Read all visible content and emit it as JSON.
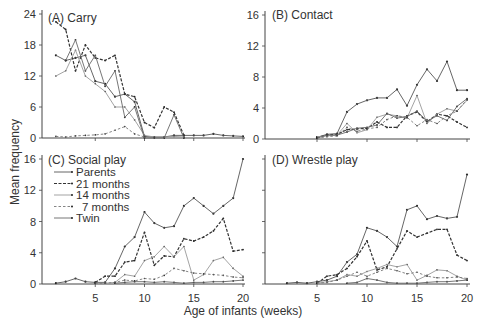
{
  "figure": {
    "ylabel": "Mean frequency",
    "xlabel": "Age of infants (weeks)",
    "legend": [
      {
        "label": "Parents",
        "style": "solid-dots"
      },
      {
        "label": "21 months",
        "style": "dashed-heavy"
      },
      {
        "label": "14 months",
        "style": "solid-light"
      },
      {
        "label": "7 months",
        "style": "dashed-light"
      },
      {
        "label": "Twin",
        "style": "solid"
      }
    ]
  },
  "chart_data": [
    {
      "type": "line",
      "title": "(A) Carry",
      "xlabel": "Age of infants (weeks)",
      "ylabel": "Mean frequency",
      "yticks": [
        0,
        6,
        12,
        18,
        24
      ],
      "ylim": [
        0,
        24
      ],
      "xticks": [
        5,
        10,
        15,
        20
      ],
      "xlim": [
        0,
        20
      ],
      "x": [
        1,
        2,
        3,
        4,
        5,
        6,
        7,
        8,
        9,
        10,
        11,
        12,
        13,
        14,
        15,
        16,
        17,
        18,
        19,
        20
      ],
      "series": [
        {
          "name": "Parents",
          "values": [
            16,
            15,
            15.5,
            16,
            11,
            10.5,
            8,
            8.5,
            7,
            0.3,
            0.2,
            0.2,
            0.5,
            0.5,
            0.5,
            0.5,
            0.8,
            0.5,
            0.4,
            0.3
          ]
        },
        {
          "name": "21 months",
          "values": [
            22.5,
            21,
            13,
            18,
            15.5,
            15,
            16,
            8.5,
            8,
            3,
            2,
            6,
            5,
            0.5,
            null,
            null,
            null,
            null,
            null,
            null
          ]
        },
        {
          "name": "14 months",
          "values": [
            12,
            13,
            17,
            12,
            10.5,
            9,
            6,
            6,
            3.5,
            0.5,
            0.2,
            0.2,
            0.3,
            0.2,
            null,
            null,
            null,
            null,
            null,
            null
          ]
        },
        {
          "name": "7 months",
          "values": [
            0.3,
            0.2,
            0.4,
            0.5,
            0.6,
            0.8,
            1.5,
            2.2,
            0.8,
            0.2,
            null,
            null,
            null,
            null,
            null,
            null,
            null,
            null,
            null,
            null
          ]
        },
        {
          "name": "Twin",
          "values": [
            null,
            15,
            19,
            13,
            16,
            10,
            13,
            4,
            6,
            0,
            0,
            0,
            4.5,
            0,
            null,
            null,
            null,
            null,
            null,
            null
          ]
        }
      ]
    },
    {
      "type": "line",
      "title": "(B) Contact",
      "xlabel": "Age of infants (weeks)",
      "ylabel": "Mean frequency",
      "yticks": [
        0,
        4,
        8,
        12,
        16
      ],
      "ylim": [
        0,
        16
      ],
      "xticks": [
        5,
        10,
        15,
        20
      ],
      "xlim": [
        0,
        20
      ],
      "x": [
        5,
        6,
        7,
        8,
        9,
        10,
        11,
        12,
        13,
        14,
        15,
        16,
        17,
        18,
        19,
        20
      ],
      "series": [
        {
          "name": "Parents",
          "values": [
            0.2,
            0.6,
            0.7,
            3.5,
            4.5,
            5,
            5.3,
            5.3,
            6.4,
            4.3,
            7,
            9,
            7.5,
            10,
            6.3,
            6.3
          ]
        },
        {
          "name": "21 months",
          "values": [
            0.2,
            0.5,
            0.6,
            1.2,
            1.3,
            1.4,
            2.2,
            1.5,
            1.5,
            3,
            3.5,
            2.2,
            3.2,
            3,
            2.2,
            1.5
          ]
        },
        {
          "name": "14 months",
          "values": [
            0.3,
            0.4,
            0.5,
            2.0,
            0.8,
            1.2,
            2.8,
            3.2,
            3.0,
            2.7,
            5.6,
            2.0,
            3.2,
            3.9,
            3.6,
            5.0
          ]
        },
        {
          "name": "7 months",
          "values": [
            0.1,
            0.3,
            0.4,
            1.5,
            1.0,
            1.3,
            1.5,
            2.5,
            3.0,
            2.8,
            1.7,
            2.5,
            2.0,
            3.0,
            3.6,
            5.1
          ]
        },
        {
          "name": "Twin",
          "values": [
            0.1,
            0.5,
            0.5,
            0.9,
            1.4,
            1.5,
            1.8,
            3.3,
            2.7,
            2.9,
            3.6,
            2.3,
            3.0,
            2.4,
            4.2,
            5.2
          ]
        }
      ]
    },
    {
      "type": "line",
      "title": "(C) Social play",
      "xlabel": "Age of infants (weeks)",
      "ylabel": "Mean frequency",
      "yticks": [
        0,
        4,
        8,
        12,
        16
      ],
      "ylim": [
        0,
        16
      ],
      "xticks": [
        5,
        10,
        15,
        20
      ],
      "xlim": [
        0,
        20
      ],
      "x": [
        1,
        2,
        3,
        4,
        5,
        6,
        7,
        8,
        9,
        10,
        11,
        12,
        13,
        14,
        15,
        16,
        17,
        18,
        19,
        20
      ],
      "series": [
        {
          "name": "Parents",
          "values": [
            0.1,
            0.3,
            0.7,
            0.3,
            0.2,
            0.2,
            2,
            4.8,
            6,
            9.2,
            7.8,
            7.2,
            7.4,
            10,
            11,
            10,
            9,
            10,
            11,
            16
          ]
        },
        {
          "name": "21 months",
          "values": [
            null,
            null,
            null,
            null,
            0.2,
            1,
            1,
            2.8,
            3,
            6.6,
            2.4,
            3.6,
            3.5,
            5.8,
            5.5,
            6,
            6.8,
            8.4,
            4.2,
            4.4
          ]
        },
        {
          "name": "14 months",
          "values": [
            null,
            null,
            null,
            null,
            0.1,
            0.1,
            0.2,
            1.2,
            1,
            3,
            3.5,
            4.8,
            3.5,
            4.8,
            0.5,
            1.2,
            3,
            3.4,
            2,
            1
          ]
        },
        {
          "name": "7 months",
          "values": [
            null,
            null,
            null,
            null,
            0.1,
            0.1,
            0.2,
            0.5,
            0.4,
            0.7,
            0.6,
            1.1,
            2,
            1.7,
            1.4,
            1.3,
            1.2,
            1.1,
            0.9,
            0.8
          ]
        },
        {
          "name": "Twin",
          "values": [
            null,
            null,
            null,
            null,
            null,
            null,
            0.1,
            0.2,
            0.3,
            0.3,
            0.2,
            0.3,
            0.2,
            0.1,
            0.2,
            0.2,
            0.3,
            0.3,
            0.4,
            0.5
          ]
        }
      ]
    },
    {
      "type": "line",
      "title": "(D) Wrestle play",
      "xlabel": "Age of infants (weeks)",
      "ylabel": "Mean frequency",
      "yticks": [
        0,
        4,
        8,
        12,
        16
      ],
      "ylim": [
        0,
        16
      ],
      "xticks": [
        5,
        10,
        15,
        20
      ],
      "xlim": [
        0,
        20
      ],
      "x": [
        2,
        3,
        4,
        5,
        6,
        7,
        8,
        9,
        10,
        11,
        12,
        13,
        14,
        15,
        16,
        17,
        18,
        19,
        20
      ],
      "series": [
        {
          "name": "Parents",
          "values": [
            0.1,
            0.2,
            0.1,
            0.3,
            0.5,
            1,
            2.8,
            3.8,
            7.2,
            6.8,
            6,
            4.8,
            9.5,
            10,
            8.3,
            8.7,
            8.4,
            8.6,
            14
          ]
        },
        {
          "name": "21 months",
          "values": [
            null,
            null,
            null,
            0.1,
            1,
            1.2,
            2,
            3.5,
            5.5,
            1.8,
            2.2,
            4.5,
            6.8,
            6,
            6.5,
            7,
            7,
            3.7,
            3
          ]
        },
        {
          "name": "14 months",
          "values": [
            null,
            null,
            null,
            0.1,
            0.3,
            0.5,
            1.2,
            1,
            1.6,
            2,
            2.5,
            2.2,
            2.5,
            0.5,
            1.1,
            1.8,
            1.7,
            1,
            0.5
          ]
        },
        {
          "name": "7 months",
          "values": [
            null,
            null,
            null,
            0.1,
            0.2,
            0.5,
            1.0,
            1.5,
            1,
            1.5,
            2,
            1.7,
            1.3,
            1.5,
            1,
            0.8,
            0.8,
            0.9,
            0.7
          ]
        },
        {
          "name": "Twin",
          "values": [
            null,
            null,
            null,
            null,
            null,
            null,
            0.1,
            0.2,
            0.7,
            0.5,
            0.2,
            0.1,
            0.1,
            0.1,
            0.2,
            0.3,
            0.3,
            0.4,
            0.5
          ]
        }
      ]
    }
  ]
}
